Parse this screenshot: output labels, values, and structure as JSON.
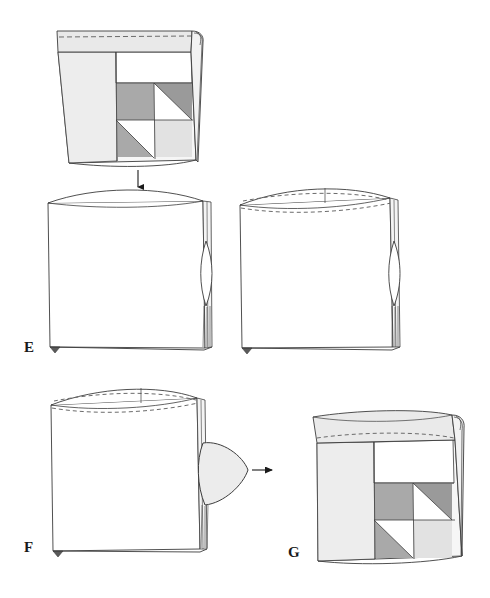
{
  "document": {
    "kind": "sewing-instruction-diagram",
    "title": "Bag construction steps E, F, G",
    "background_color": "#ffffff",
    "width": 490,
    "height": 598
  },
  "palette": {
    "outline": "#3c3c3c",
    "light_gray_fabric": "#ededed",
    "pale_gray_fabric": "#e2e2e2",
    "mid_gray_patch": "#a9a9a9",
    "dark_gray_patch": "#9a9a9a",
    "white_patch": "#ffffff",
    "stitch_dash": "#6b6b6b",
    "arrow": "#1a1a1a",
    "label_text": "#1a1a1a"
  },
  "figures": [
    {
      "id": "figure-top",
      "label": "",
      "caption": "Completed bag with patchwork front panel, top band stitched and side roll",
      "parts": [
        "top-hem-band",
        "dashed-stitch-line",
        "left-side-panel",
        "white-upper-patch",
        "patchwork-block",
        "right-roll-edge"
      ]
    },
    {
      "id": "figure-e",
      "label": "E",
      "caption": "Bag turned inside out, flat with curved top opening and side gusset lens",
      "parts": [
        "curved-top-opening",
        "body-panel",
        "side-lens-shape",
        "bottom-corner-point"
      ]
    },
    {
      "id": "figure-e-right",
      "label": "",
      "caption": "Same inside-out bag with top edge folded and dashed stitch line added",
      "parts": [
        "curved-top-edge",
        "dashed-stitch-line",
        "body-panel",
        "side-lens-shape",
        "bottom-corner-point"
      ]
    },
    {
      "id": "figure-f",
      "label": "F",
      "caption": "Bag with side gusset pulled outward through the opening",
      "parts": [
        "curved-top-edge",
        "dashed-stitch-line",
        "body-panel",
        "protruding-gusset-flap",
        "bottom-corner-point"
      ]
    },
    {
      "id": "figure-g",
      "label": "G",
      "caption": "Finished bag right side out showing patchwork panel and rolled top band",
      "parts": [
        "rolled-top-band",
        "dashed-stitch-line",
        "left-side-panel",
        "white-upper-patch",
        "patchwork-block",
        "right-roll-edge"
      ]
    }
  ],
  "arrows": [
    {
      "id": "arrow-down-top-to-e",
      "name": "arrow-down",
      "direction": "down",
      "from_figure": "figure-top",
      "to_figure": "figure-e",
      "x": 138,
      "y_start": 168,
      "y_end": 190
    },
    {
      "id": "arrow-right-f-to-g",
      "name": "arrow-right",
      "direction": "right",
      "from_figure": "figure-f",
      "to_figure": "figure-g",
      "y": 470,
      "x_start": 252,
      "x_end": 275
    }
  ],
  "labels": [
    {
      "id": "label-e",
      "text": "E",
      "x": 24,
      "y": 352
    },
    {
      "id": "label-f",
      "text": "F",
      "x": 24,
      "y": 552
    },
    {
      "id": "label-g",
      "text": "G",
      "x": 288,
      "y": 557
    }
  ],
  "patchwork": {
    "description": "Four-square block: two solid gray squares and two squares split by a white diagonal triangle",
    "rows": [
      [
        {
          "cell": "top-left",
          "fill": "mid_gray_patch",
          "triangle": "none"
        },
        {
          "cell": "top-right",
          "fill": "dark_gray_patch",
          "triangle": "lower-left-white"
        }
      ],
      [
        {
          "cell": "bottom-left",
          "fill": "mid_gray_patch",
          "triangle": "upper-right-white"
        },
        {
          "cell": "bottom-right",
          "fill": "pale_gray_fabric",
          "triangle": "none"
        }
      ]
    ]
  }
}
